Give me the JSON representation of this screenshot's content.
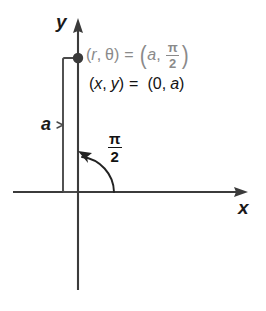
{
  "figure": {
    "background_color": "#ffffff",
    "width": 266,
    "height": 311
  },
  "colors": {
    "axis": "#3b3b3b",
    "curve": "#222222",
    "point": "#3a3a3a",
    "text_primary": "#121212",
    "text_secondary": "#8a8a8a",
    "bracket": "#4a4a4a"
  },
  "axes": {
    "y_label": "y",
    "x_label": "x",
    "origin": {
      "x": 78,
      "y": 192
    },
    "y_axis": {
      "x": 78,
      "top": 20,
      "bottom": 290,
      "arrow": "up"
    },
    "x_axis": {
      "y": 192,
      "left": 13,
      "right": 248,
      "arrow": "right"
    }
  },
  "point": {
    "name": "plotted-point",
    "x": 78,
    "y": 58,
    "radius": 5.2
  },
  "measure": {
    "label": "a",
    "bracket_x": 63,
    "bracket_top": 58,
    "bracket_bottom": 192
  },
  "angle_arc": {
    "label_numerator": "π",
    "label_denominator": "2",
    "start": {
      "x": 113,
      "y": 192
    },
    "end": {
      "x": 80,
      "y": 152
    },
    "direction": "counterclockwise",
    "arrow": "at-end"
  },
  "equations": {
    "polar": {
      "lhs_open": "(",
      "lhs_r": "r",
      "lhs_comma": ",",
      "lhs_theta": "θ",
      "lhs_close": ")",
      "equals": "=",
      "rhs_open": "(",
      "rhs_a": "a",
      "rhs_comma": ",",
      "rhs_num": "π",
      "rhs_den": "2",
      "rhs_close": ")",
      "color": "#8a8a8a"
    },
    "rectangular": {
      "lhs_open": "(",
      "lhs_x": "x",
      "lhs_comma": ",",
      "lhs_y": "y",
      "lhs_close": ")",
      "equals": "=",
      "rhs_open": "(",
      "rhs_zero": "0",
      "rhs_comma": ",",
      "rhs_a": "a",
      "rhs_close": ")",
      "color": "#121212"
    }
  }
}
